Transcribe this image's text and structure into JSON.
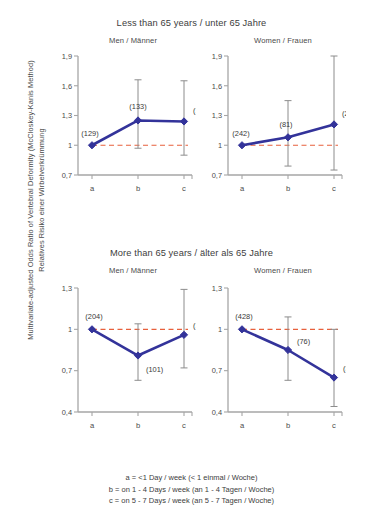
{
  "figure": {
    "ylabel_line1": "Multivariate-adjusted Odds Ratio of Vertebral Deformity (McCloskey-Kanis Method)",
    "ylabel_line2": "Relatives Risiko einer Wirbelverkrümmung"
  },
  "groups": [
    {
      "title": "Less than 65 years / unter 65 Jahre"
    },
    {
      "title": "More than 65 years / älter als 65 Jahre"
    }
  ],
  "panel_titles": {
    "men": "Men / Männer",
    "women": "Women / Frauen"
  },
  "legend": {
    "line_a": "a = <1 Day / week  (< 1 einmal / Woche)",
    "line_b": "b = on 1 - 4 Days / week  (an 1 - 4 Tagen / Woche)",
    "line_c": "c =  on 5 - 7 Days / week  (an 5 - 7 Tagen / Woche)"
  },
  "colors": {
    "series": "#33339a",
    "reference_line": "#e8603c",
    "axis": "#a6a6a6",
    "errorbar": "#8c8c8c",
    "text": "#3d3d3d"
  },
  "chart_data": [
    {
      "type": "line",
      "title": "Less than 65 years / unter 65 Jahre",
      "subtitle": "Men / Männer",
      "xlabel": "",
      "ylabel": "Multivariate-adjusted Odds Ratio of Vertebral Deformity (McCloskey-Kanis Method)",
      "categories": [
        "a",
        "b",
        "c"
      ],
      "values": [
        1.0,
        1.25,
        1.24
      ],
      "ci_low": [
        1.0,
        0.97,
        0.9
      ],
      "ci_high": [
        1.0,
        1.66,
        1.65
      ],
      "point_labels": [
        "(129)",
        "(133)",
        "(122)"
      ],
      "counts": [
        129,
        133,
        122
      ],
      "ylim": [
        0.7,
        1.9
      ],
      "yticks": [
        0.7,
        1.0,
        1.3,
        1.6,
        1.9
      ],
      "ytick_labels": [
        "0,7",
        "1",
        "1,3",
        "1,6",
        "1,9"
      ],
      "reference_line": 1.0,
      "grid": false,
      "legend_position": "none"
    },
    {
      "type": "line",
      "title": "Less than 65 years / unter 65 Jahre",
      "subtitle": "Women / Frauen",
      "xlabel": "",
      "ylabel": "",
      "categories": [
        "a",
        "b",
        "c"
      ],
      "values": [
        1.0,
        1.08,
        1.21
      ],
      "ci_low": [
        1.0,
        0.79,
        0.75
      ],
      "ci_high": [
        1.0,
        1.45,
        1.9
      ],
      "point_labels": [
        "(242)",
        "(81)",
        "(25)"
      ],
      "counts": [
        242,
        81,
        25
      ],
      "ylim": [
        0.7,
        1.9
      ],
      "yticks": [
        0.7,
        1.0,
        1.3,
        1.6,
        1.9
      ],
      "ytick_labels": [
        "0,7",
        "1",
        "1,3",
        "1,6",
        "1,9"
      ],
      "reference_line": 1.0,
      "grid": false,
      "legend_position": "none"
    },
    {
      "type": "line",
      "title": "More than 65 years / älter als 65 Jahre",
      "subtitle": "Men / Männer",
      "xlabel": "",
      "ylabel": "",
      "categories": [
        "a",
        "b",
        "c"
      ],
      "values": [
        1.0,
        0.81,
        0.96
      ],
      "ci_low": [
        1.0,
        0.63,
        0.72
      ],
      "ci_high": [
        1.0,
        1.04,
        1.29
      ],
      "point_labels": [
        "(204)",
        "(101)",
        "(120)"
      ],
      "counts": [
        204,
        101,
        120
      ],
      "ylim": [
        0.4,
        1.3
      ],
      "yticks": [
        0.4,
        0.7,
        1.0,
        1.3
      ],
      "ytick_labels": [
        "0,4",
        "0,7",
        "1",
        "1,3"
      ],
      "reference_line": 1.0,
      "grid": false,
      "legend_position": "none"
    },
    {
      "type": "line",
      "title": "More than 65 years / älter als 65 Jahre",
      "subtitle": "Women / Frauen",
      "xlabel": "",
      "ylabel": "",
      "categories": [
        "a",
        "b",
        "c"
      ],
      "values": [
        1.0,
        0.85,
        0.65
      ],
      "ci_low": [
        1.0,
        0.63,
        0.44
      ],
      "ci_high": [
        1.0,
        1.09,
        1.0
      ],
      "point_labels": [
        "(428)",
        "(76)",
        "(32)"
      ],
      "counts": [
        428,
        76,
        32
      ],
      "ylim": [
        0.4,
        1.3
      ],
      "yticks": [
        0.4,
        0.7,
        1.0,
        1.3
      ],
      "ytick_labels": [
        "0,4",
        "0,7",
        "1",
        "1,3"
      ],
      "reference_line": 1.0,
      "grid": false,
      "legend_position": "none"
    }
  ]
}
